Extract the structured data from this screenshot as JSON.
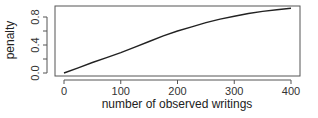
{
  "chart_data": {
    "type": "line",
    "title": "",
    "xlabel": "number of observed writings",
    "ylabel": "penalty",
    "xlim": [
      0,
      400
    ],
    "ylim": [
      0,
      0.93
    ],
    "grid": false,
    "legend": null,
    "x_ticks": [
      0,
      100,
      200,
      300,
      400
    ],
    "x_tick_labels": [
      "0",
      "100",
      "200",
      "300",
      "400"
    ],
    "y_ticks": [
      0.0,
      0.2,
      0.4,
      0.6,
      0.8
    ],
    "y_tick_labels": [
      "0.0",
      "0.4",
      "0.8"
    ],
    "y_labeled_ticks": [
      0.0,
      0.4,
      0.8
    ],
    "series": [
      {
        "name": "penalty",
        "x": [
          0,
          25,
          50,
          75,
          100,
          125,
          150,
          175,
          200,
          225,
          250,
          275,
          300,
          325,
          350,
          375,
          400
        ],
        "values": [
          0.0,
          0.075,
          0.15,
          0.22,
          0.29,
          0.37,
          0.45,
          0.53,
          0.6,
          0.66,
          0.72,
          0.77,
          0.81,
          0.85,
          0.88,
          0.905,
          0.925
        ],
        "color": "#222222"
      }
    ]
  },
  "colors": {
    "line": "#222222",
    "axis": "#555555",
    "background": "#ffffff"
  }
}
